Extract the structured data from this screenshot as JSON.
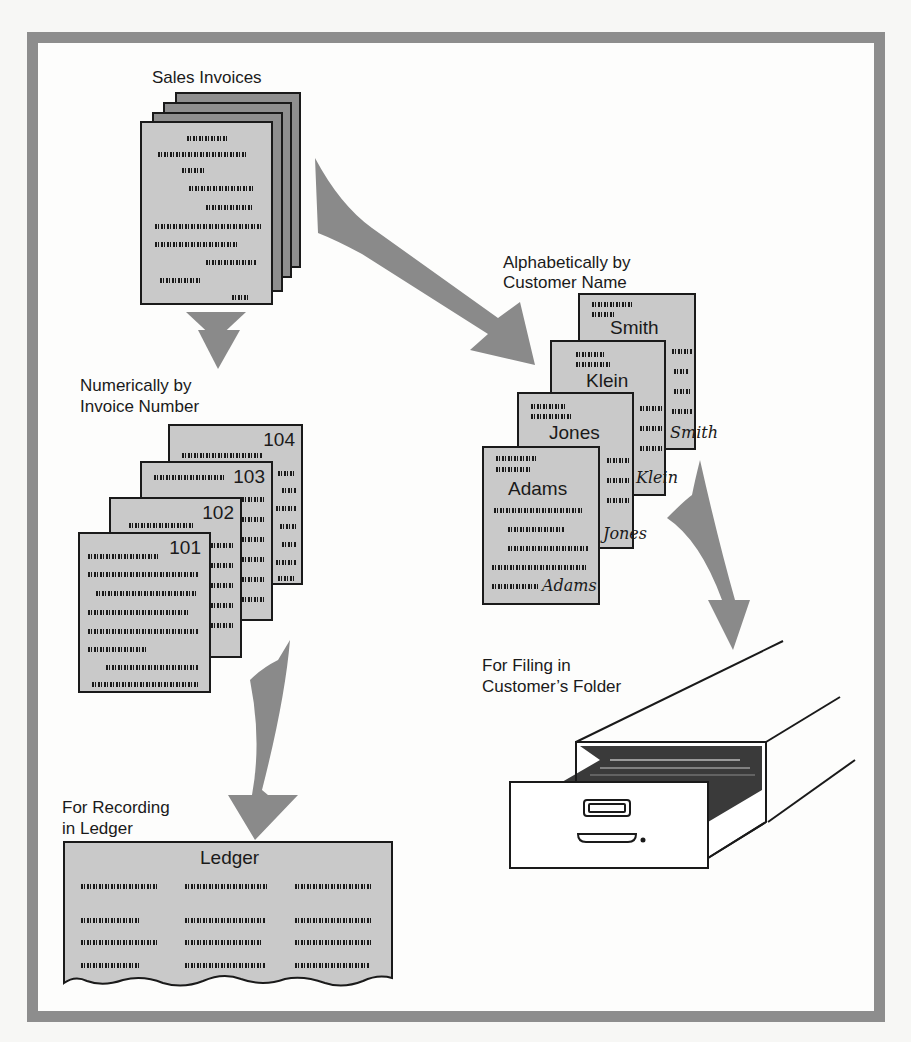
{
  "diagram": {
    "colors": {
      "frame": "#8d8d8d",
      "arrow": "#8a8a8a",
      "page_front": "#c9c9c9",
      "page_back": "#8f8f8f",
      "ink": "#1a1a1a"
    },
    "source": {
      "label": "Sales Invoices"
    },
    "branch_numeric": {
      "label_line1": "Numerically by",
      "label_line2": "Invoice Number",
      "invoices": [
        "104",
        "103",
        "102",
        "101"
      ]
    },
    "branch_alpha": {
      "label_line1": "Alphabetically by",
      "label_line2": "Customer Name",
      "cards": [
        {
          "name": "Smith",
          "signature": "Smith"
        },
        {
          "name": "Klein",
          "signature": "Klein"
        },
        {
          "name": "Jones",
          "signature": "Jones"
        },
        {
          "name": "Adams",
          "signature": "Adams"
        }
      ]
    },
    "ledger_target": {
      "label_line1": "For Recording",
      "label_line2": "in Ledger",
      "ledger_title": "Ledger"
    },
    "filing_target": {
      "label_line1": "For Filing in",
      "label_line2": "Customer’s Folder"
    },
    "arrows": [
      {
        "from": "Sales Invoices",
        "to": "Numerically by Invoice Number"
      },
      {
        "from": "Sales Invoices",
        "to": "Alphabetically by Customer Name"
      },
      {
        "from": "Numerically by Invoice Number",
        "to": "For Recording in Ledger"
      },
      {
        "from": "Alphabetically by Customer Name",
        "to": "For Filing in Customer’s Folder"
      }
    ]
  }
}
